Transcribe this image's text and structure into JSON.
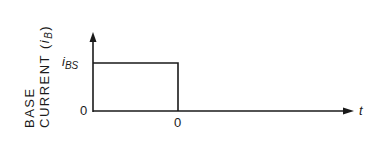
{
  "diagram": {
    "y_axis": {
      "label_line1": "BASE",
      "label_line2_prefix": "CURRENT (",
      "label_var": "i",
      "label_sub": "B",
      "label_suffix": ")",
      "tick_top_var": "i",
      "tick_top_sub": "BS",
      "tick_zero": "0"
    },
    "x_axis": {
      "label": "t",
      "tick": "0"
    },
    "waveform": {
      "type": "rectangular pulse",
      "level": "iBS",
      "ends_at": "0"
    },
    "colors": {
      "line": "#1a1a1a",
      "background": "#ffffff"
    }
  }
}
